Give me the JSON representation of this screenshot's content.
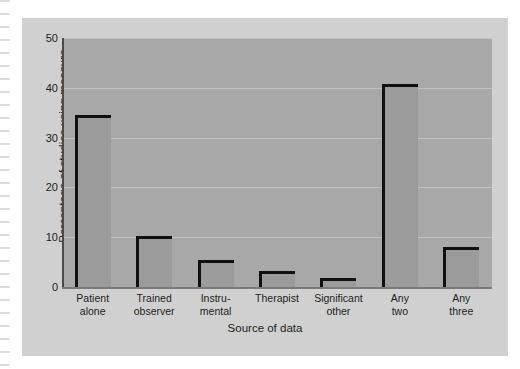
{
  "chart_data": {
    "type": "bar",
    "title": "",
    "xlabel": "Source of data",
    "ylabel": "Percentage of studies using measure",
    "ylim": [
      0,
      50
    ],
    "yticks": [
      50,
      40,
      30,
      20,
      10,
      0
    ],
    "grid": true,
    "legend": null,
    "categories": [
      "Patient alone",
      "Trained observer",
      "Instru- mental",
      "Therapist",
      "Significant other",
      "Any two",
      "Any three"
    ],
    "category_lines": [
      [
        "Patient",
        "alone"
      ],
      [
        "Trained",
        "observer"
      ],
      [
        "Instru-",
        "mental"
      ],
      [
        "Therapist",
        ""
      ],
      [
        "Significant",
        "other"
      ],
      [
        "Any",
        "two"
      ],
      [
        "Any",
        "three"
      ]
    ],
    "values": [
      34.5,
      10.3,
      5.5,
      3.2,
      1.8,
      40.7,
      8.0
    ],
    "colors": {
      "bar_fill": "#9b9b9b",
      "bar_outline": "#101010",
      "plot_background": "#a8a8a8",
      "figure_background": "#d0d0d0",
      "gridline": "#c2c2c2",
      "text": "#1d1d1d"
    }
  }
}
